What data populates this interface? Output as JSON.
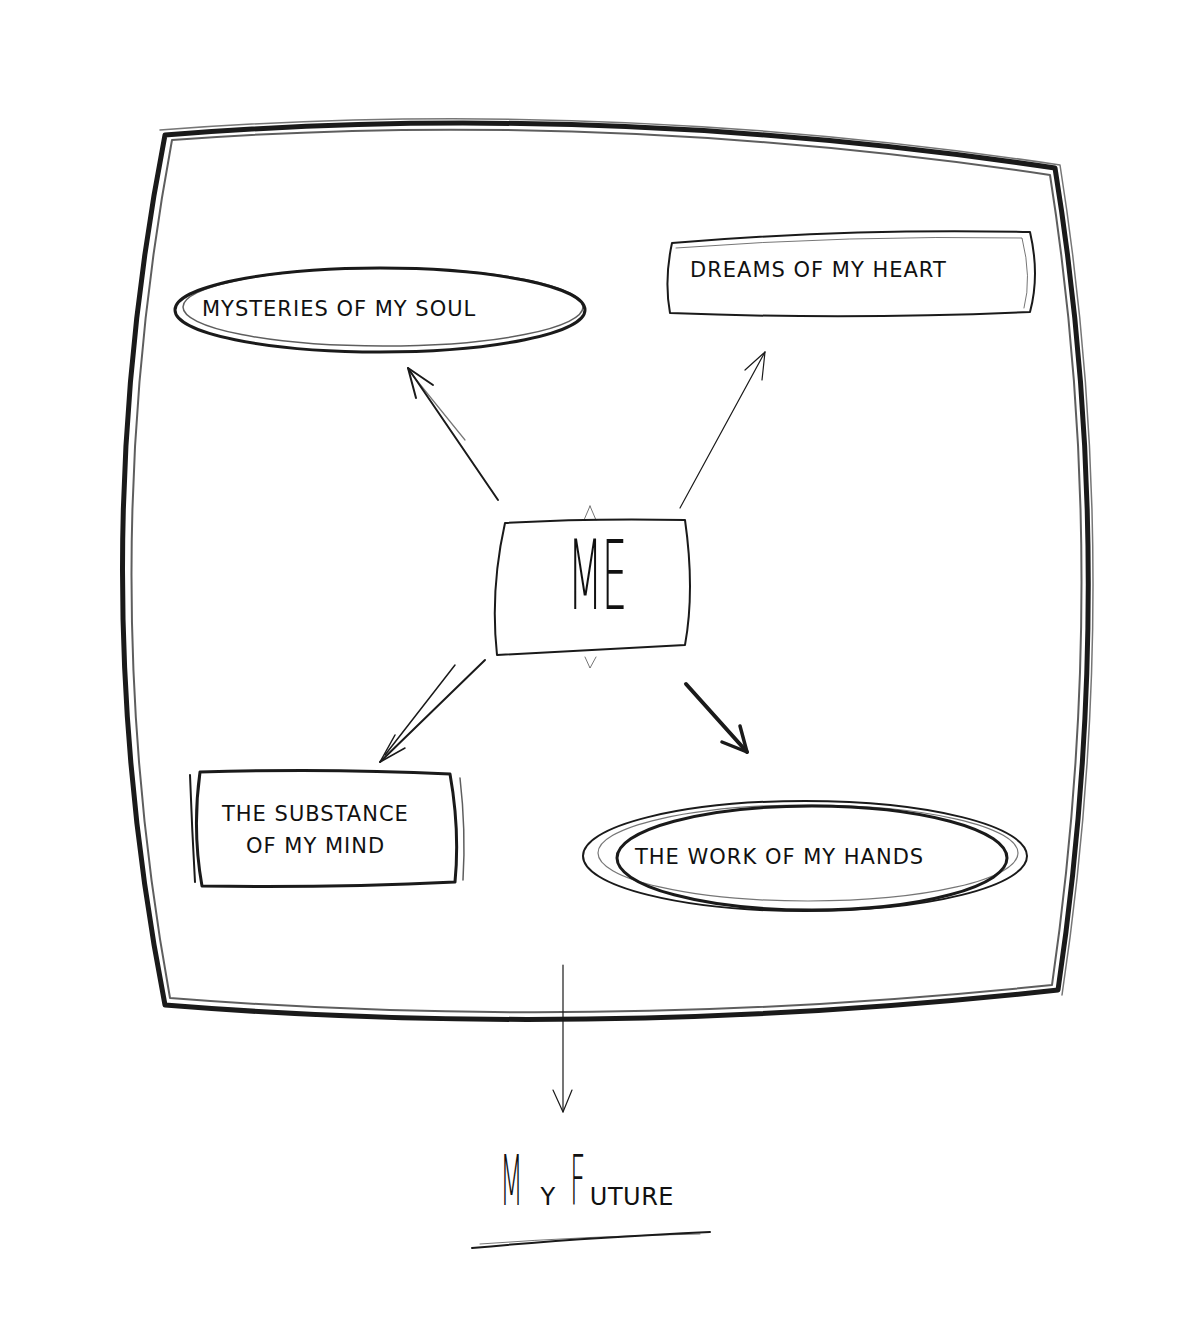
{
  "diagram": {
    "type": "hand-drawn mind map",
    "center": {
      "label": "ME"
    },
    "nodes": [
      {
        "id": "soul",
        "label": "MYSTERIES OF MY SOUL",
        "shape": "ellipse",
        "position": "top-left"
      },
      {
        "id": "heart",
        "label": "DREAMS OF MY HEART",
        "shape": "rectangle",
        "position": "top-right"
      },
      {
        "id": "mind",
        "label_line1": "THE SUBSTANCE",
        "label_line2": "OF MY MIND",
        "shape": "rectangle",
        "position": "bottom-left"
      },
      {
        "id": "hands",
        "label": "THE WORK OF MY HANDS",
        "shape": "ellipse",
        "position": "bottom-right"
      }
    ],
    "edges": [
      {
        "from": "ME",
        "to": "MYSTERIES OF MY SOUL"
      },
      {
        "from": "ME",
        "to": "DREAMS OF MY HEART"
      },
      {
        "from": "ME",
        "to": "THE SUBSTANCE OF MY MIND"
      },
      {
        "from": "ME",
        "to": "THE WORK OF MY HANDS"
      },
      {
        "from": "frame",
        "to": "MY FUTURE"
      }
    ],
    "outcome": {
      "big_m": "M",
      "small_y": "Y",
      "big_f": "F",
      "small_uture": "UTURE",
      "full": "MY FUTURE"
    },
    "colors": {
      "ink": "#111111",
      "background": "#ffffff"
    }
  }
}
